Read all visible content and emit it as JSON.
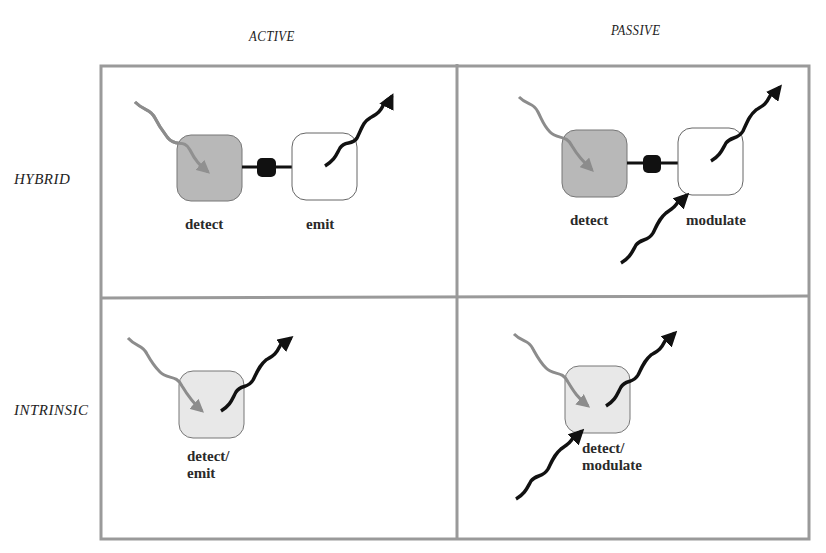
{
  "columns": [
    {
      "label": "ACTIVE"
    },
    {
      "label": "PASSIVE"
    }
  ],
  "rows": [
    {
      "label": "HYBRID"
    },
    {
      "label": "INTRINSIC"
    }
  ],
  "cells": {
    "hybrid_active": {
      "labels": [
        "detect",
        "emit"
      ]
    },
    "hybrid_passive": {
      "labels": [
        "detect",
        "modulate"
      ]
    },
    "intrinsic_active": {
      "labels": [
        "detect/",
        "emit"
      ]
    },
    "intrinsic_passive": {
      "labels": [
        "detect/",
        "modulate"
      ]
    }
  },
  "colors": {
    "frame": "#9a9a9a",
    "detect_fill": "#b8b8b8",
    "intrinsic_fill": "#e8e8e8",
    "incoming_arrow": "#8c8c8c",
    "outgoing_arrow": "#111111",
    "connector": "#111111"
  }
}
